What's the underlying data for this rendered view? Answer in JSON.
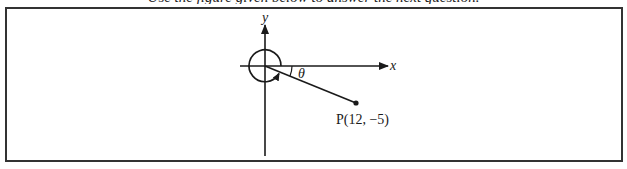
{
  "caption": {
    "text": "Use the figure given below to answer the next question."
  },
  "figure": {
    "axes": {
      "x_label": "x",
      "y_label": "y"
    },
    "angle_label": "θ",
    "point": {
      "name": "P",
      "coords": "(12, −5)",
      "label": "P(12, −5)",
      "x": 12,
      "y": -5
    },
    "rotation_arc": "counterclockwise nearly full rotation with arrowhead ending at terminal ray",
    "colors": {
      "stroke": "#1a1a1a",
      "frame": "#333333",
      "background": "#ffffff"
    }
  }
}
